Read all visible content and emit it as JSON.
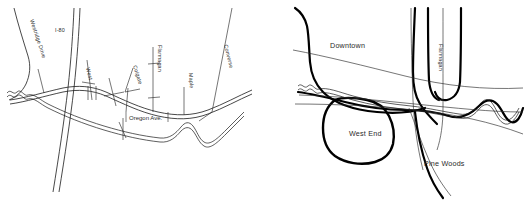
{
  "figure": {
    "type": "map-pair",
    "background_color": "#ffffff",
    "line_color": "#1a1a1a",
    "text_color": "#2a2a2a",
    "width": 531,
    "height": 210
  },
  "maps": [
    {
      "id": "street-detail-map",
      "name": "Street detail map",
      "labels": [
        {
          "key": "westridge_drive",
          "text": "Westridge Drive",
          "kind": "street",
          "orientation": "rotated",
          "x": 33,
          "y": 24
        },
        {
          "key": "i80",
          "text": "I-80",
          "kind": "highway",
          "orientation": "horizontal",
          "x": 57,
          "y": 30
        },
        {
          "key": "west",
          "text": "West",
          "kind": "street",
          "orientation": "rotated",
          "x": 85,
          "y": 74
        },
        {
          "key": "colgate",
          "text": "Colgate",
          "kind": "street",
          "orientation": "rotated",
          "x": 131,
          "y": 68
        },
        {
          "key": "flannagan",
          "text": "Flannagan",
          "kind": "street",
          "orientation": "rotated",
          "x": 159,
          "y": 50
        },
        {
          "key": "maple",
          "text": "Maple",
          "kind": "street",
          "orientation": "rotated",
          "x": 190,
          "y": 77
        },
        {
          "key": "converse",
          "text": "Converse",
          "kind": "street",
          "orientation": "rotated",
          "x": 221,
          "y": 50
        },
        {
          "key": "oregon_ave",
          "text": "Oregon Ave.",
          "kind": "street-boxed",
          "orientation": "horizontal",
          "x": 130,
          "y": 118
        }
      ]
    },
    {
      "id": "neighborhood-map",
      "name": "Neighborhood / district map",
      "labels": [
        {
          "key": "downtown",
          "text": "Downtown",
          "kind": "district",
          "orientation": "horizontal",
          "x": 330,
          "y": 46
        },
        {
          "key": "flannagan",
          "text": "Flannagan",
          "kind": "street",
          "orientation": "rotated",
          "x": 437,
          "y": 48
        },
        {
          "key": "west_end",
          "text": "West End",
          "kind": "district",
          "orientation": "horizontal",
          "x": 349,
          "y": 134
        },
        {
          "key": "pine_woods",
          "text": "Pine Woods",
          "kind": "district",
          "orientation": "horizontal",
          "x": 424,
          "y": 164
        }
      ]
    }
  ]
}
